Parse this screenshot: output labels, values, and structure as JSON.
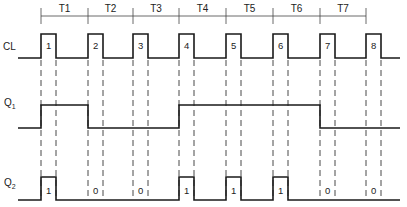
{
  "diagram": {
    "type": "timing-diagram",
    "periods": [
      "T1",
      "T2",
      "T3",
      "T4",
      "T5",
      "T6",
      "T7"
    ],
    "signals": [
      {
        "name": "CL",
        "label": "CL",
        "subscript": "",
        "pulse_labels": [
          "1",
          "2",
          "3",
          "4",
          "5",
          "6",
          "7",
          "8"
        ]
      },
      {
        "name": "Q1",
        "label": "Q",
        "subscript": "1",
        "levels": [
          1,
          0,
          0,
          1,
          1,
          1,
          0
        ]
      },
      {
        "name": "Q2",
        "label": "Q",
        "subscript": "2",
        "pulse_labels": [
          "1",
          "0",
          "0",
          "1",
          "1",
          "1",
          "0",
          "0"
        ]
      }
    ],
    "edge_x": [
      41,
      88,
      133,
      179,
      226,
      273,
      320,
      366
    ],
    "pulse_width": 15
  }
}
